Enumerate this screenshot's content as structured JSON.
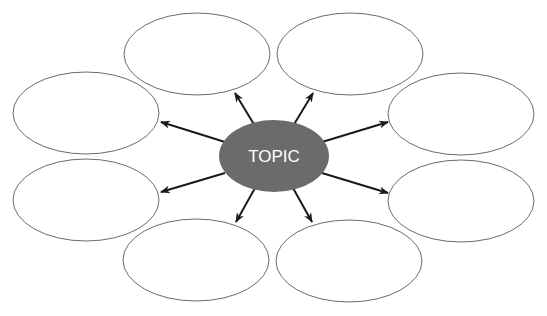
{
  "diagram": {
    "type": "bubble-map",
    "center": {
      "label": "TOPIC",
      "fill": "#6b6b6b",
      "text_color": "#ffffff"
    },
    "bubbles": [
      {
        "id": "top-left",
        "label": ""
      },
      {
        "id": "top-right",
        "label": ""
      },
      {
        "id": "left-upper",
        "label": ""
      },
      {
        "id": "right-upper",
        "label": ""
      },
      {
        "id": "left-lower",
        "label": ""
      },
      {
        "id": "right-lower",
        "label": ""
      },
      {
        "id": "bottom-left",
        "label": ""
      },
      {
        "id": "bottom-right",
        "label": ""
      }
    ],
    "colors": {
      "bubble_stroke": "#6a6a6a",
      "arrow": "#1a1a1a",
      "background": "#ffffff"
    }
  }
}
